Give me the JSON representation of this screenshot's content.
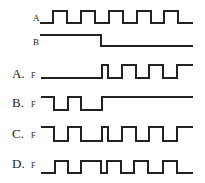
{
  "diagram": {
    "type": "timing-diagram",
    "inputs": [
      {
        "name": "A",
        "label": "A",
        "label_pos": [
          33,
          14
        ],
        "high_y": 11,
        "low_y": 23,
        "points": [
          [
            40,
            23
          ],
          [
            53,
            23
          ],
          [
            53,
            11
          ],
          [
            67,
            11
          ],
          [
            67,
            23
          ],
          [
            81,
            23
          ],
          [
            81,
            11
          ],
          [
            95,
            11
          ],
          [
            95,
            23
          ],
          [
            109,
            23
          ],
          [
            109,
            11
          ],
          [
            123,
            11
          ],
          [
            123,
            23
          ],
          [
            137,
            23
          ],
          [
            137,
            11
          ],
          [
            151,
            11
          ],
          [
            151,
            23
          ],
          [
            164,
            23
          ],
          [
            164,
            11
          ],
          [
            178,
            11
          ],
          [
            178,
            23
          ],
          [
            193,
            23
          ]
        ]
      },
      {
        "name": "B",
        "label": "B",
        "label_pos": [
          33,
          38
        ],
        "high_y": 35,
        "low_y": 46,
        "points": [
          [
            40,
            35
          ],
          [
            101,
            35
          ],
          [
            101,
            46
          ],
          [
            193,
            46
          ]
        ]
      }
    ],
    "options": [
      {
        "name": "A",
        "label": "A.",
        "f_label": "F",
        "label_pos": [
          12,
          67
        ],
        "f_pos": [
          31,
          72
        ],
        "points": [
          [
            41,
            78
          ],
          [
            102,
            78
          ],
          [
            102,
            65
          ],
          [
            108,
            65
          ],
          [
            108,
            78
          ],
          [
            122,
            78
          ],
          [
            122,
            65
          ],
          [
            136,
            65
          ],
          [
            136,
            78
          ],
          [
            149,
            78
          ],
          [
            149,
            65
          ],
          [
            163,
            65
          ],
          [
            163,
            78
          ],
          [
            177,
            78
          ],
          [
            177,
            65
          ],
          [
            193,
            65
          ]
        ]
      },
      {
        "name": "B",
        "label": "B.",
        "f_label": "F",
        "label_pos": [
          12,
          96
        ],
        "f_pos": [
          31,
          101
        ],
        "points": [
          [
            41,
            97
          ],
          [
            54,
            97
          ],
          [
            54,
            110
          ],
          [
            68,
            110
          ],
          [
            68,
            97
          ],
          [
            81,
            97
          ],
          [
            81,
            110
          ],
          [
            102,
            110
          ],
          [
            102,
            97
          ],
          [
            193,
            97
          ]
        ]
      },
      {
        "name": "C",
        "label": "C.",
        "f_label": "F",
        "label_pos": [
          12,
          127
        ],
        "f_pos": [
          31,
          132
        ],
        "points": [
          [
            41,
            127
          ],
          [
            54,
            127
          ],
          [
            54,
            141
          ],
          [
            68,
            141
          ],
          [
            68,
            127
          ],
          [
            81,
            127
          ],
          [
            81,
            141
          ],
          [
            102,
            141
          ],
          [
            102,
            127
          ],
          [
            108,
            127
          ],
          [
            108,
            141
          ],
          [
            122,
            141
          ],
          [
            122,
            127
          ],
          [
            136,
            127
          ],
          [
            136,
            141
          ],
          [
            149,
            141
          ],
          [
            149,
            127
          ],
          [
            163,
            127
          ],
          [
            163,
            141
          ],
          [
            177,
            141
          ],
          [
            177,
            127
          ],
          [
            193,
            127
          ]
        ]
      },
      {
        "name": "D",
        "label": "D.",
        "f_label": "F",
        "label_pos": [
          12,
          157
        ],
        "f_pos": [
          31,
          162
        ],
        "points": [
          [
            41,
            173
          ],
          [
            55,
            173
          ],
          [
            55,
            161
          ],
          [
            68,
            161
          ],
          [
            68,
            173
          ],
          [
            81,
            173
          ],
          [
            81,
            161
          ],
          [
            101,
            161
          ],
          [
            101,
            173
          ],
          [
            107,
            173
          ],
          [
            107,
            161
          ],
          [
            121,
            161
          ],
          [
            121,
            173
          ],
          [
            134,
            173
          ],
          [
            134,
            161
          ],
          [
            148,
            161
          ],
          [
            148,
            173
          ],
          [
            163,
            173
          ],
          [
            163,
            161
          ],
          [
            177,
            161
          ],
          [
            177,
            173
          ],
          [
            193,
            173
          ]
        ]
      }
    ],
    "colors": {
      "line": "#222222",
      "background": "#ffffff"
    }
  }
}
